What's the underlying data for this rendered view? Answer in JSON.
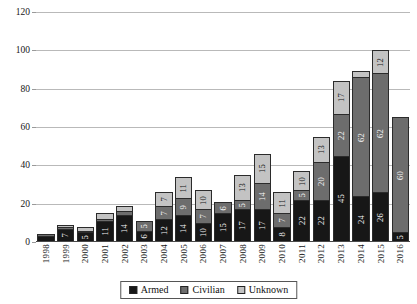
{
  "chart_data": {
    "type": "bar",
    "stacked": true,
    "title": "",
    "xlabel": "",
    "ylabel": "",
    "ylim": [
      0,
      120
    ],
    "yticks": [
      0,
      20,
      40,
      60,
      80,
      100,
      120
    ],
    "grid": true,
    "legend_position": "bottom",
    "categories": [
      "1998",
      "1999",
      "2000",
      "2001",
      "2002",
      "2003",
      "2004",
      "2005",
      "2006",
      "2007",
      "2008",
      "2009",
      "2010",
      "2011",
      "2012",
      "2013",
      "2014",
      "2015",
      "2016"
    ],
    "series": [
      {
        "name": "Armed",
        "color": "#171717",
        "values": [
          3,
          7,
          5,
          11,
          14,
          6,
          12,
          14,
          10,
          15,
          17,
          17,
          8,
          22,
          22,
          45,
          24,
          26,
          5
        ]
      },
      {
        "name": "Civilian",
        "color": "#6d6d6d",
        "values": [
          1,
          1,
          1,
          1,
          2,
          5,
          7,
          9,
          7,
          6,
          5,
          14,
          7,
          5,
          20,
          22,
          62,
          62,
          60
        ]
      },
      {
        "name": "Unknown",
        "color": "#c3c3c3",
        "values": [
          0,
          1,
          2,
          3,
          3,
          0,
          7,
          11,
          10,
          0,
          13,
          15,
          11,
          10,
          13,
          17,
          3,
          12,
          0
        ]
      }
    ],
    "totals": [
      4,
      9,
      8,
      15,
      19,
      11,
      26,
      34,
      27,
      21,
      35,
      46,
      26,
      37,
      55,
      84,
      89,
      100,
      65
    ]
  },
  "legend": {
    "items": [
      {
        "label": "Armed",
        "swatch": "armed-swatch"
      },
      {
        "label": "Civilian",
        "swatch": "civilian-swatch"
      },
      {
        "label": "Unknown",
        "swatch": "unknown-swatch"
      }
    ]
  },
  "axis": {
    "y_tick_labels": [
      "0",
      "20",
      "40",
      "60",
      "80",
      "100",
      "120"
    ],
    "x_tick_labels": [
      "1998",
      "1999",
      "2000",
      "2001",
      "2002",
      "2003",
      "2004",
      "2005",
      "2006",
      "2007",
      "2008",
      "2009",
      "2010",
      "2011",
      "2012",
      "2013",
      "2014",
      "2015",
      "2016"
    ]
  }
}
